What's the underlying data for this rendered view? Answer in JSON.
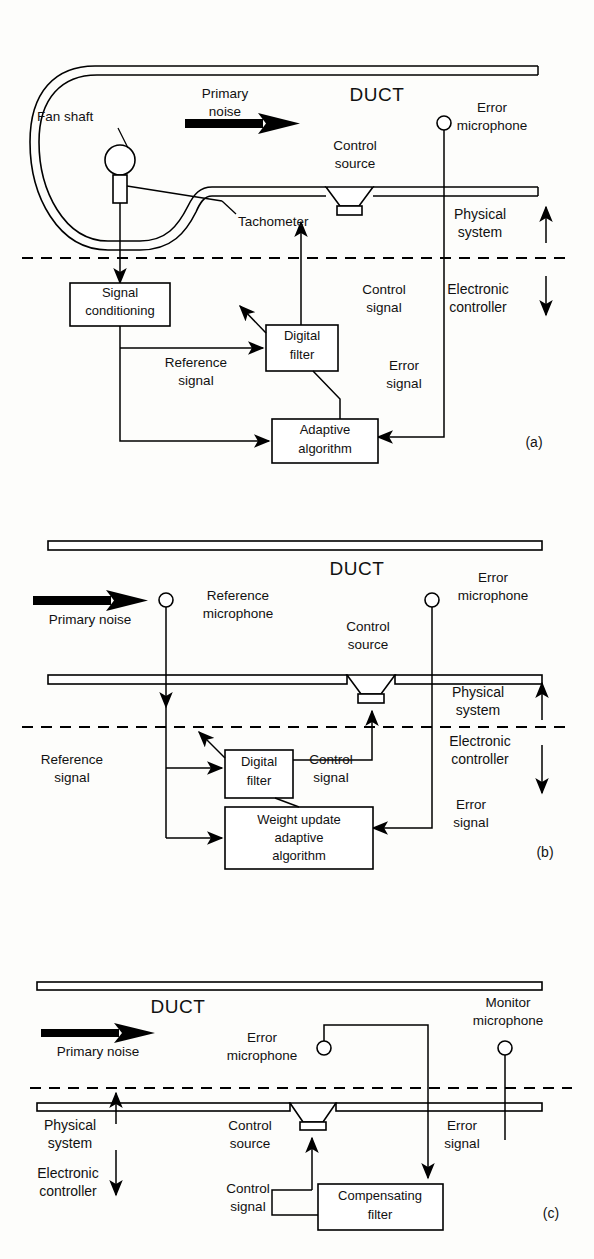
{
  "figure": {
    "caption_labels": [
      "(a)",
      "(b)",
      "(c)"
    ],
    "duct_title": "DUCT"
  },
  "panel_a": {
    "tag": "(a)",
    "duct_label": "DUCT",
    "labels": {
      "fan_shaft": "Fan shaft",
      "primary_noise_line1": "Primary",
      "primary_noise_line2": "noise",
      "tachometer": "Tachometer",
      "control_source_line1": "Control",
      "control_source_line2": "source",
      "error_microphone_line1": "Error",
      "error_microphone_line2": "microphone",
      "physical_system_line1": "Physical",
      "physical_system_line2": "system",
      "electronic_controller_line1": "Electronic",
      "electronic_controller_line2": "controller",
      "control_signal_line1": "Control",
      "control_signal_line2": "signal",
      "error_signal_line1": "Error",
      "error_signal_line2": "signal",
      "reference_signal_line1": "Reference",
      "reference_signal_line2": "signal"
    },
    "blocks": [
      {
        "id": "signal-conditioning",
        "line1": "Signal",
        "line2": "conditioning"
      },
      {
        "id": "digital-filter",
        "line1": "Digital",
        "line2": "filter"
      },
      {
        "id": "adaptive-algorithm",
        "line1": "Adaptive",
        "line2": "algorithm"
      }
    ]
  },
  "panel_b": {
    "tag": "(b)",
    "duct_label": "DUCT",
    "labels": {
      "primary_noise": "Primary  noise",
      "reference_microphone_line1": "Reference",
      "reference_microphone_line2": "microphone",
      "control_source_line1": "Control",
      "control_source_line2": "source",
      "error_microphone_line1": "Error",
      "error_microphone_line2": "microphone",
      "physical_system_line1": "Physical",
      "physical_system_line2": "system",
      "electronic_controller_line1": "Electronic",
      "electronic_controller_line2": "controller",
      "reference_signal_line1": "Reference",
      "reference_signal_line2": "signal",
      "control_signal_line1": "Control",
      "control_signal_line2": "signal",
      "error_signal_line1": "Error",
      "error_signal_line2": "signal"
    },
    "blocks": [
      {
        "id": "digital-filter",
        "line1": "Digital",
        "line2": "filter"
      },
      {
        "id": "weight-update-adaptive-algorithm",
        "line1": "Weight  update",
        "line2": "adaptive",
        "line3": "algorithm"
      }
    ]
  },
  "panel_c": {
    "tag": "(c)",
    "duct_label": "DUCT",
    "labels": {
      "primary_noise": "Primary  noise",
      "error_microphone_line1": "Error",
      "error_microphone_line2": "microphone",
      "monitor_microphone_line1": "Monitor",
      "monitor_microphone_line2": "microphone",
      "control_source_line1": "Control",
      "control_source_line2": "source",
      "physical_system_line1": "Physical",
      "physical_system_line2": "system",
      "electronic_controller_line1": "Electronic",
      "electronic_controller_line2": "controller",
      "control_signal_line1": "Control",
      "control_signal_line2": "signal",
      "error_signal_line1": "Error",
      "error_signal_line2": "signal"
    },
    "blocks": [
      {
        "id": "compensating-filter",
        "line1": "Compensating",
        "line2": "filter"
      }
    ]
  },
  "colors": {
    "ink": "#000000",
    "paper": "#fdfdfb"
  }
}
